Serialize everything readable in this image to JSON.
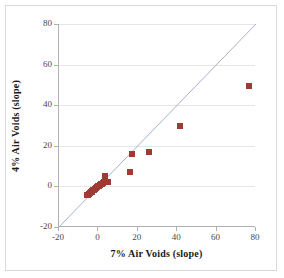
{
  "chart_data": {
    "type": "scatter",
    "title": "",
    "xlabel": "7% Air Voids (slope)",
    "ylabel": "4% Air Voids (slope)",
    "xlim": [
      -20,
      80
    ],
    "ylim": [
      -20,
      80
    ],
    "xticks": [
      -20,
      0,
      20,
      40,
      60,
      80
    ],
    "yticks": [
      -20,
      0,
      20,
      40,
      60,
      80
    ],
    "xtick_labels": [
      "-20",
      "0",
      "20",
      "40",
      "60",
      "80"
    ],
    "ytick_labels": [
      "-20",
      "0",
      "20",
      "40",
      "60",
      "80"
    ],
    "grid": "horizontal",
    "legend": "none",
    "marker_color": "#9e3b33",
    "marker_shape": "square",
    "reference_line": {
      "name": "line-of-equality",
      "type": "line",
      "color": "#8c9ec4",
      "x": [
        -20,
        80
      ],
      "y": [
        -20,
        80
      ]
    },
    "series": [
      {
        "name": "Air voids slope comparison",
        "points": [
          [
            -6.0,
            -4.2
          ],
          [
            -5.4,
            -4.0
          ],
          [
            -4.8,
            -3.6
          ],
          [
            -4.3,
            -3.2
          ],
          [
            -3.9,
            -3.0
          ],
          [
            -3.4,
            -2.6
          ],
          [
            -3.0,
            -2.3
          ],
          [
            -2.6,
            -2.0
          ],
          [
            -2.2,
            -1.6
          ],
          [
            -1.8,
            -1.3
          ],
          [
            -1.4,
            -1.0
          ],
          [
            -1.0,
            -0.6
          ],
          [
            -0.6,
            -0.3
          ],
          [
            -0.2,
            0.1
          ],
          [
            0.3,
            0.4
          ],
          [
            0.8,
            0.8
          ],
          [
            1.2,
            1.1
          ],
          [
            1.7,
            1.4
          ],
          [
            2.1,
            1.8
          ],
          [
            2.6,
            2.1
          ],
          [
            3.0,
            2.4
          ],
          [
            3.4,
            5.0
          ],
          [
            3.8,
            2.0
          ],
          [
            4.3,
            2.2
          ],
          [
            4.8,
            2.4
          ],
          [
            15.9,
            7.2
          ],
          [
            17.3,
            15.8
          ],
          [
            25.5,
            16.8
          ],
          [
            41.3,
            30.0
          ],
          [
            76.2,
            49.3
          ]
        ]
      }
    ]
  }
}
